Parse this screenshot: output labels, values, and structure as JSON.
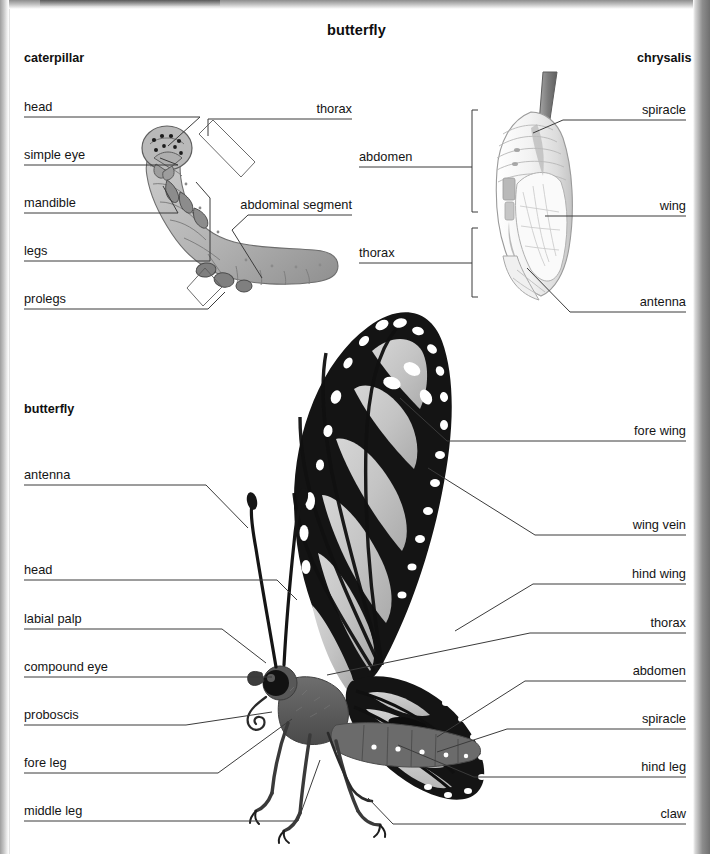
{
  "page": {
    "title": "butterfly",
    "cut_header_text": ""
  },
  "sections": {
    "caterpillar": {
      "heading": "caterpillar"
    },
    "chrysalis": {
      "heading": "chrysalis"
    },
    "butterfly": {
      "heading": "butterfly"
    }
  },
  "labels": {
    "caterpillar_left": [
      {
        "text": "head",
        "y": 107
      },
      {
        "text": "simple eye",
        "y": 155
      },
      {
        "text": "mandible",
        "y": 203
      },
      {
        "text": "legs",
        "y": 251
      },
      {
        "text": "prolegs",
        "y": 299
      }
    ],
    "caterpillar_right": [
      {
        "text": "thorax",
        "y": 109
      },
      {
        "text": "abdominal segment",
        "y": 205
      }
    ],
    "chrysalis_left": [
      {
        "text": "abdomen",
        "y": 157
      },
      {
        "text": "thorax",
        "y": 253
      }
    ],
    "chrysalis_right": [
      {
        "text": "spiracle",
        "y": 110
      },
      {
        "text": "wing",
        "y": 206
      },
      {
        "text": "antenna",
        "y": 302
      }
    ],
    "butterfly_left": [
      {
        "text": "antenna",
        "y": 475
      },
      {
        "text": "head",
        "y": 570
      },
      {
        "text": "labial palp",
        "y": 619
      },
      {
        "text": "compound eye",
        "y": 667
      },
      {
        "text": "proboscis",
        "y": 715
      },
      {
        "text": "fore leg",
        "y": 763
      },
      {
        "text": "middle leg",
        "y": 811
      }
    ],
    "butterfly_right": [
      {
        "text": "fore wing",
        "y": 431
      },
      {
        "text": "wing vein",
        "y": 525
      },
      {
        "text": "hind wing",
        "y": 574
      },
      {
        "text": "thorax",
        "y": 623
      },
      {
        "text": "abdomen",
        "y": 671
      },
      {
        "text": "spiracle",
        "y": 719
      },
      {
        "text": "hind leg",
        "y": 767
      },
      {
        "text": "claw",
        "y": 814
      }
    ]
  },
  "colors": {
    "page": "#ffffff",
    "text": "#141414",
    "leader": "#3b3b3b",
    "caterpillar_body": "#b5b5b5",
    "caterpillar_shade": "#8f8f8f",
    "chrysalis_body": "#f4f4f4",
    "chrysalis_shade": "#cfcfcf",
    "wing_cell": "#c9c9c9",
    "wing_vein": "#1b1b1b",
    "body_dark": "#5f5f5f",
    "scan_edge": "#8d8d8d"
  }
}
